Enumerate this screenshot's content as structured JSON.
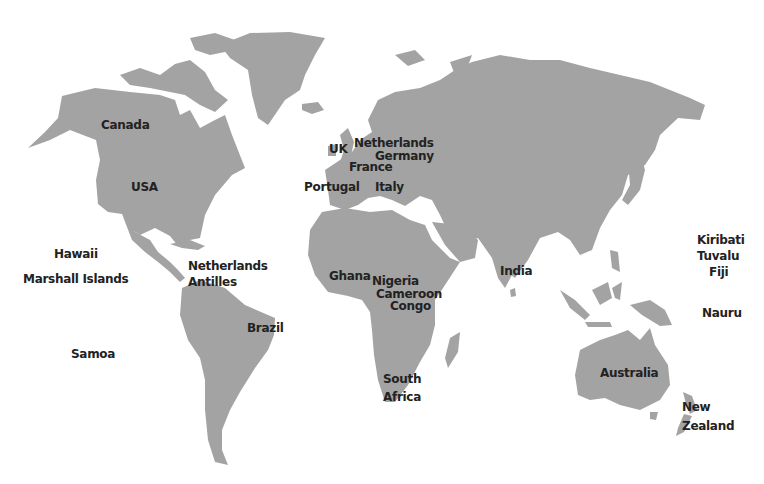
{
  "map": {
    "title": "World map of countries",
    "land_color": "#a3a3a3",
    "label_color": "#222222",
    "labels": [
      {
        "id": "canada",
        "text": "Canada",
        "x": 101,
        "y": 119
      },
      {
        "id": "usa",
        "text": "USA",
        "x": 131,
        "y": 181
      },
      {
        "id": "uk",
        "text": "UK",
        "x": 329,
        "y": 143
      },
      {
        "id": "netherlands",
        "text": "Netherlands",
        "x": 354,
        "y": 137
      },
      {
        "id": "germany",
        "text": "Germany",
        "x": 375,
        "y": 150
      },
      {
        "id": "france",
        "text": "France",
        "x": 349,
        "y": 161
      },
      {
        "id": "portugal",
        "text": "Portugal",
        "x": 304,
        "y": 181
      },
      {
        "id": "italy",
        "text": "Italy",
        "x": 375,
        "y": 181
      },
      {
        "id": "hawaii",
        "text": "Hawaii",
        "x": 54,
        "y": 248
      },
      {
        "id": "marshall-islands",
        "text": "Marshall Islands",
        "x": 23,
        "y": 273
      },
      {
        "id": "netherlands-antilles-1",
        "text": "Netherlands",
        "x": 188,
        "y": 260
      },
      {
        "id": "netherlands-antilles-2",
        "text": "Antilles",
        "x": 188,
        "y": 276
      },
      {
        "id": "brazil",
        "text": "Brazil",
        "x": 247,
        "y": 322
      },
      {
        "id": "samoa",
        "text": "Samoa",
        "x": 71,
        "y": 348
      },
      {
        "id": "ghana",
        "text": "Ghana",
        "x": 329,
        "y": 270
      },
      {
        "id": "nigeria",
        "text": "Nigeria",
        "x": 372,
        "y": 275
      },
      {
        "id": "cameroon",
        "text": "Cameroon",
        "x": 376,
        "y": 288
      },
      {
        "id": "congo",
        "text": "Congo",
        "x": 390,
        "y": 300
      },
      {
        "id": "india",
        "text": "India",
        "x": 500,
        "y": 265
      },
      {
        "id": "south-africa-1",
        "text": "South",
        "x": 383,
        "y": 373
      },
      {
        "id": "south-africa-2",
        "text": "Africa",
        "x": 383,
        "y": 391
      },
      {
        "id": "kiribati",
        "text": "Kiribati",
        "x": 697,
        "y": 234
      },
      {
        "id": "tuvalu",
        "text": "Tuvalu",
        "x": 697,
        "y": 250
      },
      {
        "id": "fiji",
        "text": "Fiji",
        "x": 709,
        "y": 266
      },
      {
        "id": "nauru",
        "text": "Nauru",
        "x": 702,
        "y": 307
      },
      {
        "id": "australia",
        "text": "Australia",
        "x": 600,
        "y": 367
      },
      {
        "id": "new-zealand-1",
        "text": "New",
        "x": 682,
        "y": 401
      },
      {
        "id": "new-zealand-2",
        "text": "Zealand",
        "x": 682,
        "y": 420
      }
    ]
  }
}
